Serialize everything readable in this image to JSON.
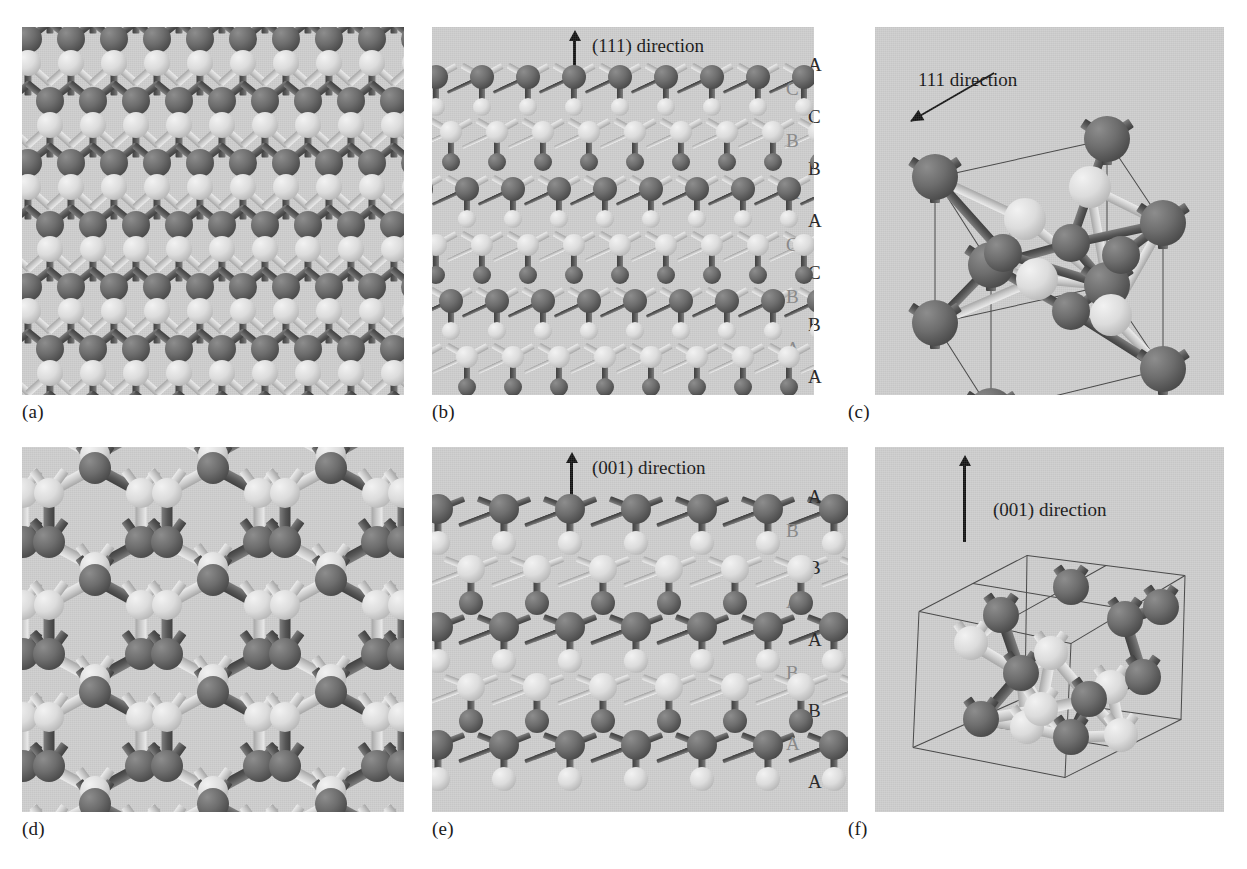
{
  "figure": {
    "background": "#ffffff",
    "panel_background": "#cbcbcb",
    "atom_dark_color": "#6d6d6d",
    "atom_light_color": "#dcdcdc",
    "bond_color": "#8a8a8a",
    "cell_edge_color": "#4a4a4a",
    "text_color": "#121212"
  },
  "panels": [
    {
      "id": "a",
      "caption": "(a)",
      "description": "Dense zinc-blende lattice viewed along a low-index axis, alternating dark and light atom sublattices",
      "direction_label": null,
      "stacking_outer": [],
      "stacking_inner": []
    },
    {
      "id": "b",
      "caption": "(b)",
      "description": "Lattice viewed perpendicular to the (111) direction showing ABCABC layer stacking",
      "direction_label": "(111) direction",
      "arrow": "up",
      "stacking_outer": [
        "A",
        "C",
        "B",
        "A",
        "C",
        "B",
        "A"
      ],
      "stacking_inner": [
        "C",
        "B",
        "A",
        "C",
        "B",
        "A"
      ]
    },
    {
      "id": "c",
      "caption": "(c)",
      "description": "Single cubic unit cell with wireframe edges, tilted to show the 111 body diagonal",
      "direction_label": "111 direction",
      "arrow": "diagonal-upper-left",
      "stacking_outer": [],
      "stacking_inner": []
    },
    {
      "id": "d",
      "caption": "(d)",
      "description": "Lattice viewed along the (001) direction showing open hexagonal channels",
      "direction_label": null,
      "stacking_outer": [],
      "stacking_inner": []
    },
    {
      "id": "e",
      "caption": "(e)",
      "description": "Lattice viewed perpendicular to the (001) direction showing ABAB layer stacking",
      "direction_label": "(001) direction",
      "arrow": "up",
      "stacking_outer": [
        "A",
        "B",
        "A",
        "B",
        "A"
      ],
      "stacking_inner": [
        "B",
        "A",
        "B",
        "A"
      ]
    },
    {
      "id": "f",
      "caption": "(f)",
      "description": "Tilted cubic unit cell wireframe with the (001) axis vertical",
      "direction_label": "(001) direction",
      "arrow": "up",
      "stacking_outer": [],
      "stacking_inner": []
    }
  ]
}
